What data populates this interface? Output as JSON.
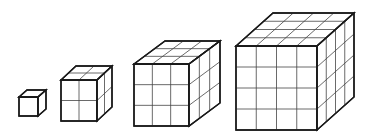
{
  "figure": {
    "stroke_color": "#1a1a1a",
    "grid_color": "#444444",
    "background": "#ffffff",
    "cubes": [
      {
        "n": 1,
        "fx": 19,
        "fy": 97,
        "fw": 19,
        "fh": 19,
        "dx": 8,
        "dy": -7
      },
      {
        "n": 2,
        "fx": 61,
        "fy": 80,
        "fw": 36,
        "fh": 41,
        "dx": 15,
        "dy": -14
      },
      {
        "n": 3,
        "fx": 134,
        "fy": 64,
        "fw": 55,
        "fh": 62,
        "dx": 31,
        "dy": -23
      },
      {
        "n": 4,
        "fx": 236,
        "fy": 46,
        "fw": 81,
        "fh": 84,
        "dx": 37,
        "dy": -33
      }
    ]
  }
}
